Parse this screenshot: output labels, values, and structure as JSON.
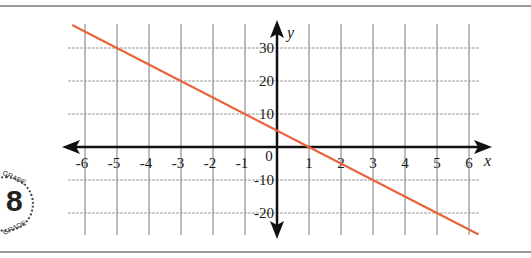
{
  "chart_data": {
    "type": "line",
    "title": "",
    "xlabel": "x",
    "ylabel": "y",
    "xlim": [
      -6.4,
      6.7
    ],
    "ylim": [
      -27,
      37
    ],
    "x_ticks": [
      -6,
      -5,
      -4,
      -3,
      -2,
      -1,
      0,
      1,
      2,
      3,
      4,
      5,
      6
    ],
    "x_tick_labels": [
      "-6",
      "-5",
      "-4",
      "-3",
      "-2",
      "-1",
      "0",
      "1",
      "2",
      "3",
      "4",
      "5",
      "6"
    ],
    "y_ticks": [
      30,
      20,
      10,
      -10,
      -20
    ],
    "y_tick_labels": [
      "30",
      "20",
      "10",
      "-10",
      "-20"
    ],
    "grid": true,
    "series": [
      {
        "name": "y = -5x + 5",
        "equation": {
          "slope": -5,
          "intercept": 5
        },
        "x": [
          -6.4,
          6.3
        ],
        "values": [
          37,
          -26.5
        ],
        "points_on_grid": [
          [
            -5,
            30
          ],
          [
            -3,
            20
          ],
          [
            -1,
            10
          ],
          [
            1,
            0
          ],
          [
            3,
            -10
          ],
          [
            5,
            -20
          ]
        ],
        "color": "#e8643c"
      }
    ]
  },
  "logo": {
    "number": "8",
    "text_top": "GRADE",
    "text_bottom": "GRADE"
  }
}
